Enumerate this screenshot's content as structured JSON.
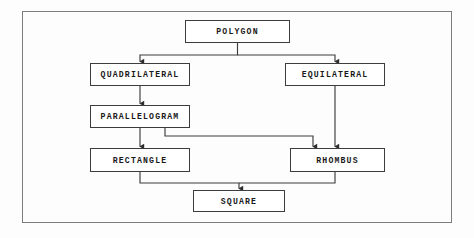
{
  "diagram": {
    "type": "flowchart",
    "background_color": "#fdfdfd",
    "frame_color": "#7d7d7d",
    "node_border_color": "#3d3d3d",
    "connector_color": "#3d3d3d",
    "text_color": "#1a1a1a",
    "nodes": [
      {
        "id": "polygon",
        "label": "POLYGON",
        "x": 185,
        "y": 20,
        "w": 105,
        "h": 23
      },
      {
        "id": "quadrilateral",
        "label": "QUADRILATERAL",
        "x": 90,
        "y": 63,
        "w": 100,
        "h": 23
      },
      {
        "id": "equilateral",
        "label": "EQUILATERAL",
        "x": 285,
        "y": 63,
        "w": 100,
        "h": 23
      },
      {
        "id": "parallelogram",
        "label": "PARALLELOGRAM",
        "x": 90,
        "y": 105,
        "w": 100,
        "h": 23
      },
      {
        "id": "rectangle",
        "label": "RECTANGLE",
        "x": 90,
        "y": 148,
        "w": 100,
        "h": 24
      },
      {
        "id": "rhombus",
        "label": "RHOMBUS",
        "x": 290,
        "y": 148,
        "w": 95,
        "h": 24
      },
      {
        "id": "square",
        "label": "SQUARE",
        "x": 193,
        "y": 190,
        "w": 92,
        "h": 22
      }
    ],
    "edges": [
      {
        "id": "polygon-to-quadrilateral",
        "from": "polygon",
        "to": "quadrilateral",
        "arrow": true
      },
      {
        "id": "polygon-to-equilateral",
        "from": "polygon",
        "to": "equilateral",
        "arrow": true
      },
      {
        "id": "quadrilateral-to-parallelogram",
        "from": "quadrilateral",
        "to": "parallelogram",
        "arrow": true
      },
      {
        "id": "parallelogram-to-rectangle",
        "from": "parallelogram",
        "to": "rectangle",
        "arrow": true
      },
      {
        "id": "parallelogram-to-rhombus",
        "from": "parallelogram",
        "to": "rhombus",
        "arrow": true
      },
      {
        "id": "equilateral-to-rhombus",
        "from": "equilateral",
        "to": "rhombus",
        "arrow": true
      },
      {
        "id": "rectangle-to-square",
        "from": "rectangle",
        "to": "square",
        "arrow": true
      },
      {
        "id": "rhombus-to-square",
        "from": "rhombus",
        "to": "square",
        "arrow": true
      }
    ]
  }
}
